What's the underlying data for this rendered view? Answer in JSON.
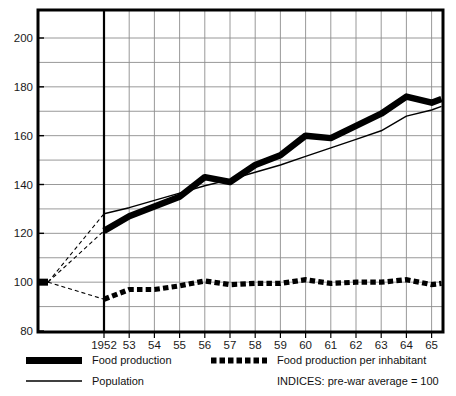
{
  "chart_data": {
    "type": "line",
    "title": "",
    "subtitle": "",
    "xlabel": "",
    "ylabel": "",
    "xlim": [
      1948.8,
      1965.6
    ],
    "ylim": [
      80,
      208
    ],
    "ytick_step": 10,
    "yticks_major": [
      80,
      100,
      120,
      140,
      160,
      180,
      200
    ],
    "ytick_labels": [
      "80",
      "100",
      "120",
      "140",
      "160",
      "180",
      "200"
    ],
    "grid": true,
    "grid_note": "horizontal gridlines every 10 units; vertical gridline at each year tick",
    "legend_position": "below-axes",
    "baseline_note": "pre-war average = 100 anchor point plotted at far left, joined to 1952 by dashed leaders",
    "prewar_anchor": {
      "label": "pre-war average",
      "value": 100
    },
    "categories": [
      1952,
      1953,
      1954,
      1955,
      1956,
      1957,
      1958,
      1959,
      1960,
      1961,
      1962,
      1963,
      1964,
      1965
    ],
    "category_labels": [
      "1952",
      "53",
      "54",
      "55",
      "56",
      "57",
      "58",
      "59",
      "60",
      "61",
      "62",
      "63",
      "64",
      "65"
    ],
    "series": [
      {
        "name": "Food production",
        "style": "thick-solid",
        "values": [
          121,
          127,
          131,
          135,
          143,
          141,
          148,
          152,
          160,
          159,
          164,
          169,
          176,
          173.5
        ],
        "end_value": 175
      },
      {
        "name": "Population",
        "style": "thin-solid",
        "values": [
          128,
          130.5,
          133.5,
          136.5,
          139.5,
          142,
          145,
          148,
          151.5,
          155,
          158.5,
          162,
          168,
          170.5
        ],
        "end_value": 172
      },
      {
        "name": "Food production per inhabitant",
        "style": "dotted-thick",
        "values": [
          93,
          97,
          97,
          98.5,
          100.5,
          99,
          99.5,
          99.5,
          101,
          99.5,
          100,
          100,
          101,
          99
        ],
        "end_value": 99.5
      }
    ]
  },
  "legend": {
    "items": [
      {
        "key": "food-production",
        "label": "Food production",
        "style": "thick-solid"
      },
      {
        "key": "population",
        "label": "Population",
        "style": "thin-solid"
      },
      {
        "key": "food-production-per-inhabitant",
        "label": "Food production per inhabitant",
        "style": "dotted-thick"
      }
    ],
    "note": "INDICES: pre-war average = 100"
  },
  "colors": {
    "ink": "#000000",
    "grid": "#8d8d8d",
    "frame": "#000000",
    "background": "#ffffff"
  }
}
